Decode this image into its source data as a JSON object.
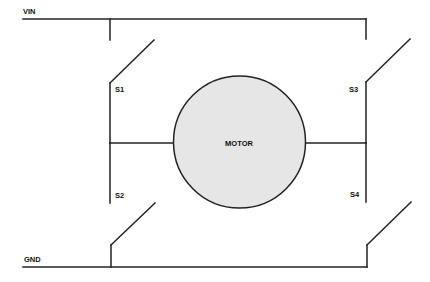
{
  "diagram": {
    "type": "H-bridge motor driver schematic",
    "rails": {
      "top": {
        "label": "VIN"
      },
      "bottom": {
        "label": "GND"
      }
    },
    "switches": [
      {
        "id": "S1",
        "label": "S1",
        "position": "top-left"
      },
      {
        "id": "S2",
        "label": "S2",
        "position": "bottom-left"
      },
      {
        "id": "S3",
        "label": "S3",
        "position": "top-right"
      },
      {
        "id": "S4",
        "label": "S4",
        "position": "bottom-right"
      }
    ],
    "load": {
      "label": "MOTOR",
      "fill": "#e6e6e6"
    },
    "colors": {
      "line": "#222222",
      "background": "#ffffff"
    }
  }
}
